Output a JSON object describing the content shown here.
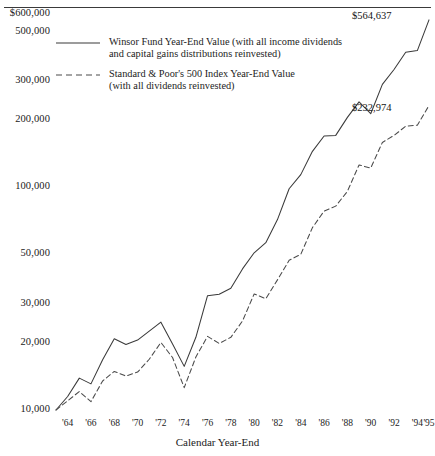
{
  "figure": {
    "axis_title": "Calendar Year-End",
    "rule": "top-horizontal-rule"
  },
  "legend": {
    "items": [
      {
        "key": "solid-line",
        "line_style": "solid",
        "label_line1": "Winsor Fund Year-End Value (with all income dividends",
        "label_line2": "and capital gains distributions reinvested)"
      },
      {
        "key": "dashed-line",
        "line_style": "dashed",
        "label_line1": "Standard & Poor's 500 Index Year-End Value",
        "label_line2": "(with all dividends reinvested)"
      }
    ]
  },
  "end_labels": {
    "winsor": "$564,637",
    "sp500": "$232,974"
  },
  "chart_data": {
    "type": "line",
    "title": "",
    "subtitle": "",
    "xlabel": "Calendar Year-End",
    "ylabel": "",
    "yscale": "log",
    "ylim": [
      10000,
      600000
    ],
    "xlim": [
      1963,
      1995
    ],
    "grid": false,
    "legend_position": "upper-left-inside",
    "ytick_labels": [
      "$600,000",
      "500,000",
      "300,000",
      "200,000",
      "100,000",
      "50,000",
      "30,000",
      "20,000",
      "10,000"
    ],
    "ytick_values": [
      600000,
      500000,
      300000,
      200000,
      100000,
      50000,
      30000,
      20000,
      10000
    ],
    "xtick_labels": [
      "'64",
      "'66",
      "'68",
      "'70",
      "'72",
      "'74",
      "'76",
      "'78",
      "'80",
      "'82",
      "'84",
      "'86",
      "'88",
      "'90",
      "'92",
      "'94",
      "'95"
    ],
    "xtick_values": [
      1964,
      1966,
      1968,
      1970,
      1972,
      1974,
      1976,
      1978,
      1980,
      1982,
      1984,
      1986,
      1988,
      1990,
      1992,
      1994,
      1995
    ],
    "x": [
      1963,
      1964,
      1965,
      1966,
      1967,
      1968,
      1969,
      1970,
      1971,
      1972,
      1973,
      1974,
      1975,
      1976,
      1977,
      1978,
      1979,
      1980,
      1981,
      1982,
      1983,
      1984,
      1985,
      1986,
      1987,
      1988,
      1989,
      1990,
      1991,
      1992,
      1993,
      1994,
      1995
    ],
    "series": [
      {
        "name": "Winsor Fund Year-End Value (with all income dividends and capital gains distributions reinvested)",
        "line_style": "solid",
        "color": "#3a3a3a",
        "end_label": "$564,637",
        "values": [
          10000,
          11500,
          13900,
          13100,
          16800,
          20900,
          19700,
          20600,
          22600,
          24800,
          19800,
          15700,
          21200,
          32600,
          33100,
          35200,
          43000,
          50800,
          56400,
          71600,
          98500,
          114000,
          145000,
          170000,
          171000,
          206000,
          242000,
          214000,
          290000,
          338000,
          404000,
          411000,
          564637
        ]
      },
      {
        "name": "Standard & Poor's 500 Index Year-End Value (with all dividends reinvested)",
        "line_style": "dashed",
        "color": "#4a4a4a",
        "end_label": "$232,974",
        "values": [
          10000,
          11000,
          12100,
          10900,
          13500,
          14900,
          14200,
          14800,
          16900,
          20100,
          17200,
          12600,
          17300,
          21400,
          19900,
          21200,
          25100,
          33200,
          31600,
          38400,
          47000,
          50000,
          65900,
          78200,
          82300,
          95900,
          126000,
          122000,
          159000,
          171000,
          188000,
          190000,
          232974
        ]
      }
    ]
  }
}
